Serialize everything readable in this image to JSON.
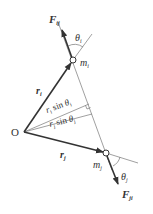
{
  "diagram": {
    "origin_label": "O",
    "vectors": [
      {
        "id": "r_i",
        "label": "r",
        "subscript": "i"
      },
      {
        "id": "r_j",
        "label": "r",
        "subscript": "j"
      }
    ],
    "forces": [
      {
        "id": "F_ij",
        "label": "F",
        "subscript": "ij"
      },
      {
        "id": "F_ji",
        "label": "F",
        "subscript": "ji"
      }
    ],
    "masses": [
      {
        "id": "m_i",
        "label": "m",
        "subscript": "i"
      },
      {
        "id": "m_j",
        "label": "m",
        "subscript": "j"
      }
    ],
    "angles": [
      {
        "id": "theta_i",
        "label": "θ",
        "subscript": "i"
      },
      {
        "id": "theta_j",
        "label": "θ",
        "subscript": "j"
      }
    ],
    "distances": [
      {
        "id": "ri_sin_thetai",
        "text_r": "r",
        "sub_r": "i",
        "text_mid": " sin ",
        "text_theta": "θ",
        "sub_theta": "i"
      },
      {
        "id": "rj_sin_thetaj",
        "text_r": "r",
        "sub_r": "j",
        "text_mid": " sin ",
        "text_theta": "θ",
        "sub_theta": "j"
      }
    ],
    "colors": {
      "line": "#333333",
      "thin": "#666666"
    }
  }
}
